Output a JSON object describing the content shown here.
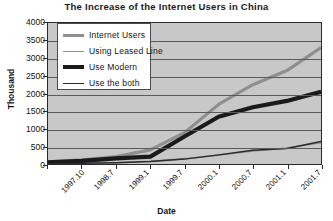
{
  "chart_data": {
    "type": "line",
    "title": "The Increase of the Internet Users in China",
    "xlabel": "Date",
    "ylabel": "Thousand",
    "grid": true,
    "legend_position": "top-left-inside",
    "ylim": [
      0,
      4000
    ],
    "yticks": [
      "4000",
      "3500",
      "3000",
      "2500",
      "2000",
      "1500",
      "1000",
      "500",
      "0"
    ],
    "ytick_values": [
      4000,
      3500,
      3000,
      2500,
      2000,
      1500,
      1000,
      500,
      0
    ],
    "categories": [
      "1997.10",
      "1998.7",
      "1999.1",
      "1999.7",
      "2000.1",
      "2000.7",
      "2001.1",
      "2001.7",
      "2002.1"
    ],
    "x": [
      "1997.10",
      "1998.7",
      "1999.1",
      "1999.7",
      "2000.1",
      "2000.7",
      "2001.1",
      "2001.7",
      "2002.1"
    ],
    "series": [
      {
        "name": "Internet Users",
        "color": "#8f8f8f",
        "width": 3.2,
        "values": [
          62,
          117,
          210,
          400,
          890,
          1690,
          2250,
          2650,
          3300
        ]
      },
      {
        "name": "Using Leased Line",
        "color": "#8f8f8f",
        "width": 1.4,
        "values": [
          0,
          25,
          40,
          76,
          150,
          250,
          364,
          454,
          600
        ]
      },
      {
        "name": "Use Modern",
        "color": "#1a1a1a",
        "width": 4.2,
        "values": [
          49,
          90,
          160,
          210,
          780,
          1340,
          1610,
          1790,
          2050
        ]
      },
      {
        "name": "Use the both",
        "color": "#2a2a2a",
        "width": 1.4,
        "values": [
          0,
          20,
          35,
          70,
          140,
          260,
          390,
          440,
          640
        ]
      }
    ]
  },
  "chart": {
    "plot_background": "#c8c8c8",
    "gridline_color": "#5a5a5a",
    "axis_color": "#2a2a2a",
    "legend_background": "#ffffff"
  }
}
